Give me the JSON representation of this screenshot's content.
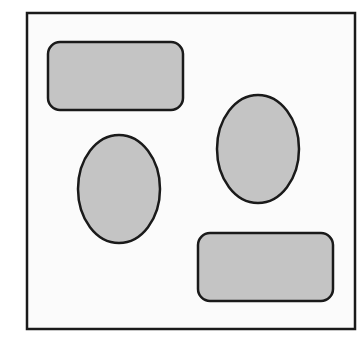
{
  "diagram": {
    "title": "",
    "colors": {
      "background": "#ffffff",
      "frame_fill": "#fbfbfb",
      "stroke": "#1a1a1a",
      "shape_fill": "#c4c4c4"
    },
    "shapes": [
      {
        "id": "rect-top-left",
        "kind": "rounded-rectangle"
      },
      {
        "id": "ellipse-left",
        "kind": "ellipse"
      },
      {
        "id": "ellipse-right",
        "kind": "ellipse"
      },
      {
        "id": "rect-bottom-right",
        "kind": "rounded-rectangle"
      }
    ]
  }
}
